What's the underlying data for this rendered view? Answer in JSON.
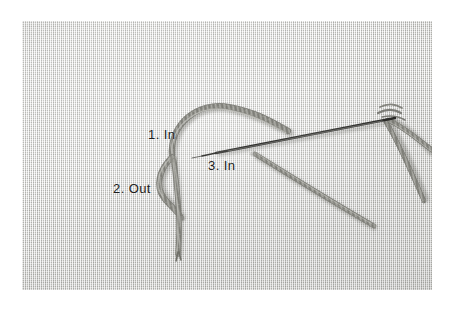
{
  "image": {
    "kind": "photograph",
    "subject": "embroidery-stitch-tutorial",
    "width": 455,
    "height": 316,
    "background_color": "#ffffff"
  },
  "photo": {
    "left": 22,
    "top": 21,
    "width": 410,
    "height": 269,
    "fabric": {
      "name": "woven-burlap-linen",
      "base_color": "#d4d4d1",
      "weave_light": "#ffffff",
      "weave_dark": "#969692"
    }
  },
  "labels": [
    {
      "id": "step-1",
      "text": "1. In",
      "x": 148,
      "y": 127
    },
    {
      "id": "step-2",
      "text": "2. Out",
      "x": 113,
      "y": 181
    },
    {
      "id": "step-3",
      "text": "3. In",
      "x": 208,
      "y": 158
    }
  ],
  "caption": {
    "text": "",
    "visible": false
  },
  "objects": {
    "needle": {
      "name": "sewing-needle",
      "color": "#3a3a38",
      "tip_x": 216,
      "tip_y": 151,
      "eye_x": 392,
      "eye_y": 118
    },
    "thread": {
      "name": "embroidery-thread",
      "color": "#8b8b85",
      "highlight_color": "#c9c9c3",
      "shadow_color": "#5f5f5a"
    },
    "loop": {
      "name": "thread-loop",
      "description": "curved open loop rising from the 1. In point and returning to the 2. Out point"
    },
    "tail": {
      "name": "thread-tail",
      "description": "vertical thread descending from the 1. In point to the lower fabric"
    }
  }
}
